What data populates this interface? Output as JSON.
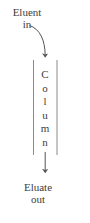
{
  "diagram": {
    "type": "chromatography-column-schematic",
    "background_color": "#ffffff",
    "stroke_color": "#555555",
    "text_color": "#3d3d3d",
    "inlet_label": {
      "line1": "Eluent",
      "line2": "in"
    },
    "outlet_label": {
      "line1": "Eluate",
      "line2": "out"
    },
    "column_label": {
      "text": "Column",
      "orientation": "vertical-stacked-letters",
      "letters": [
        "C",
        "o",
        "l",
        "u",
        "m",
        "n"
      ]
    },
    "inlet_arrow": {
      "name": "curved-inlet-arrow",
      "shape": "curve",
      "direction": "down"
    },
    "outlet_arrow": {
      "name": "straight-outlet-arrow",
      "shape": "line",
      "direction": "down"
    },
    "column_body": {
      "left_wall": "vertical-line",
      "right_wall": "vertical-line"
    }
  }
}
